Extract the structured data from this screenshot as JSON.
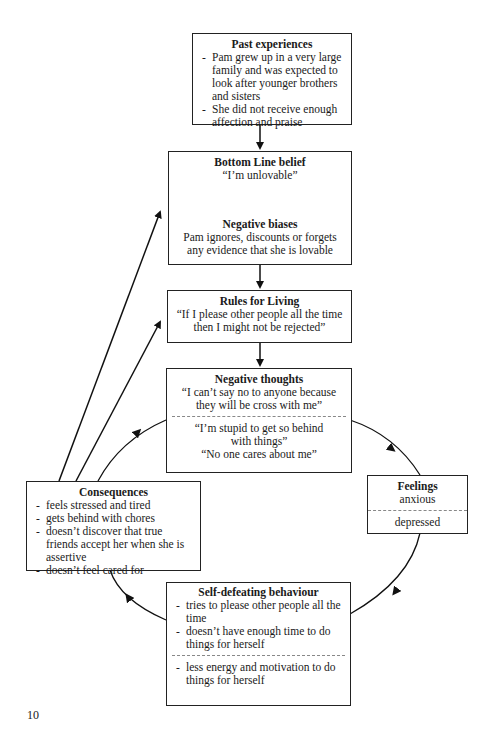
{
  "past_experiences": {
    "title": "Past experiences",
    "items": [
      "Pam grew up in a very large family and was expected to look after younger brothers and sisters",
      "She did not receive enough affection and praise"
    ]
  },
  "bottom_line": {
    "title": "Bottom Line belief",
    "quote": "“I’m unlovable”",
    "biases_title": "Negative biases",
    "biases_text": "Pam ignores, discounts or forgets any evidence that she is lovable"
  },
  "rules_for_living": {
    "title": "Rules for Living",
    "quote": "“If I please other people all the time then I might not be rejected”"
  },
  "negative_thoughts": {
    "title": "Negative thoughts",
    "quote1": "“I can’t say no to anyone because they will be cross with me”",
    "quote2": "“I’m stupid to get so behind with things”",
    "quote3": "“No one cares about me”"
  },
  "feelings": {
    "title": "Feelings",
    "item1": "anxious",
    "item2": "depressed"
  },
  "self_defeating": {
    "title": "Self-defeating behaviour",
    "items": [
      "tries to please other people all the time",
      "doesn’t have enough time to do things for herself"
    ],
    "items2": [
      "less energy and motivation to do things for herself"
    ]
  },
  "consequences": {
    "title": "Consequences",
    "items": [
      "feels stressed and tired",
      "gets behind with chores",
      "doesn’t discover that true friends accept her when she is assertive",
      "doesn’t feel cared for"
    ]
  },
  "page_number": "10"
}
